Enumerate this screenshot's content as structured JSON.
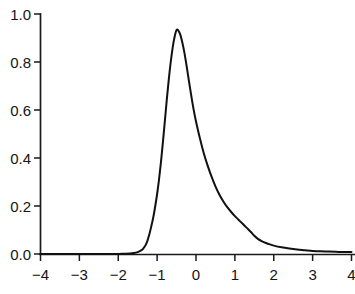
{
  "chart_data": {
    "type": "line",
    "title": "",
    "subtitle": "",
    "xlabel": "",
    "ylabel": "",
    "xlim": [
      -4,
      4
    ],
    "ylim": [
      0.0,
      1.0
    ],
    "grid": false,
    "legend": null,
    "annotations": [],
    "xticks": [
      -4,
      -3,
      -2,
      -1,
      0,
      1,
      2,
      3,
      4
    ],
    "xticklabels": [
      "−4",
      "−3",
      "−2",
      "−1",
      "0",
      "1",
      "2",
      "3",
      "4"
    ],
    "yticks": [
      0.0,
      0.2,
      0.4,
      0.6,
      0.8,
      1.0
    ],
    "yticklabels": [
      "0.0",
      "0.2",
      "0.4",
      "0.6",
      "0.8",
      "1.0"
    ],
    "series": [
      {
        "name": "density",
        "color": "#111111",
        "x": [
          -4.0,
          -3.75,
          -3.5,
          -3.25,
          -3.0,
          -2.75,
          -2.5,
          -2.25,
          -2.0,
          -1.85,
          -1.7,
          -1.6,
          -1.5,
          -1.4,
          -1.35,
          -1.3,
          -1.25,
          -1.2,
          -1.15,
          -1.1,
          -1.05,
          -1.0,
          -0.95,
          -0.9,
          -0.85,
          -0.8,
          -0.75,
          -0.7,
          -0.65,
          -0.6,
          -0.55,
          -0.5,
          -0.45,
          -0.4,
          -0.35,
          -0.3,
          -0.25,
          -0.2,
          -0.15,
          -0.1,
          -0.05,
          0.0,
          0.1,
          0.2,
          0.3,
          0.4,
          0.5,
          0.6,
          0.7,
          0.8,
          0.9,
          1.0,
          1.1,
          1.2,
          1.3,
          1.4,
          1.5,
          1.6,
          1.7,
          1.8,
          1.9,
          2.0,
          2.2,
          2.4,
          2.6,
          2.8,
          3.0,
          3.2,
          3.4,
          3.6,
          3.8,
          4.0
        ],
        "y": [
          0.0,
          0.0,
          0.0,
          0.0,
          0.0,
          0.0,
          0.0,
          0.0,
          0.0,
          0.001,
          0.002,
          0.004,
          0.008,
          0.016,
          0.024,
          0.036,
          0.055,
          0.082,
          0.115,
          0.152,
          0.198,
          0.25,
          0.312,
          0.385,
          0.468,
          0.556,
          0.645,
          0.728,
          0.8,
          0.86,
          0.905,
          0.933,
          0.93,
          0.912,
          0.88,
          0.84,
          0.792,
          0.74,
          0.688,
          0.638,
          0.592,
          0.552,
          0.482,
          0.42,
          0.368,
          0.322,
          0.282,
          0.248,
          0.22,
          0.196,
          0.176,
          0.158,
          0.142,
          0.126,
          0.11,
          0.094,
          0.076,
          0.062,
          0.053,
          0.046,
          0.04,
          0.035,
          0.028,
          0.023,
          0.019,
          0.016,
          0.013,
          0.011,
          0.01,
          0.009,
          0.008,
          0.008
        ]
      }
    ],
    "peak": {
      "x": -0.5,
      "y": 0.933
    }
  }
}
